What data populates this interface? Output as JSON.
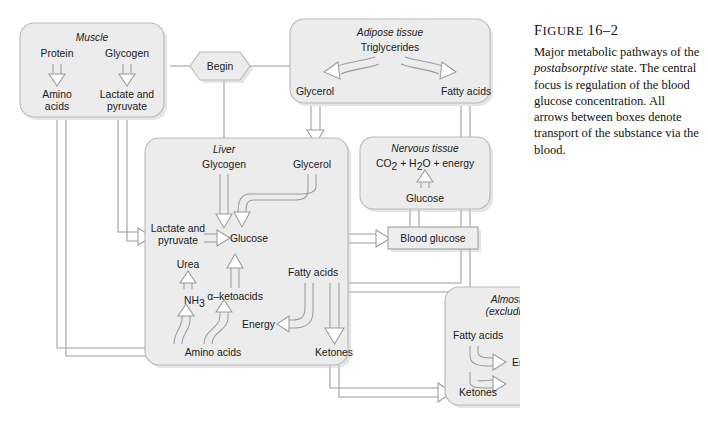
{
  "figure": {
    "label_prefix": "F",
    "label_rest": "IGURE",
    "number": "16–2",
    "caption_part1": "Major metabolic pathways of the ",
    "caption_italic": "postabsorptive",
    "caption_part2": " state. The central focus is regulation of the blood glucose concentration. All arrows between boxes denote transport of the substance via the blood."
  },
  "colors": {
    "box_fill": "#ececed",
    "box_stroke": "#b9b9bb",
    "connector": "#9b9b9e",
    "text": "#1a1a1a",
    "page_bg": "#ffffff"
  },
  "start_node": {
    "label": "Begin"
  },
  "boxes": {
    "muscle": {
      "title": "Muscle",
      "nodes": [
        "Protein",
        "Glycogen",
        "Amino",
        "acids",
        "Lactate and",
        "pyruvate"
      ]
    },
    "adipose": {
      "title": "Adipose tissue",
      "nodes": [
        "Triglycerides",
        "Glycerol",
        "Fatty acids"
      ]
    },
    "liver": {
      "title": "Liver",
      "nodes": [
        "Glycogen",
        "Glycerol",
        "Lactate and",
        "pyruvate",
        "Glucose",
        "Urea",
        "NH",
        "3",
        "α–ketoacids",
        "Fatty acids",
        "Energy",
        "Amino acids",
        "Ketones"
      ]
    },
    "nervous": {
      "title": "Nervous tissue",
      "product_pre": "CO",
      "product_sub1": "2",
      "product_mid": " + H",
      "product_sub2": "2",
      "product_post": "O + energy",
      "substrate": "Glucose"
    },
    "blood_glucose": {
      "label": "Blood glucose"
    },
    "tissues": {
      "title_line1": "Almost all tissues",
      "title_line2": "(excluding nervous)",
      "node_fatty": "Fatty acids",
      "node_ketones": "Ketones",
      "product_line1_pre": "Energy + CO",
      "product_line1_sub": "2",
      "product_line2_pre": "+ H",
      "product_line2_sub": "2",
      "product_line2_post": "O"
    }
  }
}
